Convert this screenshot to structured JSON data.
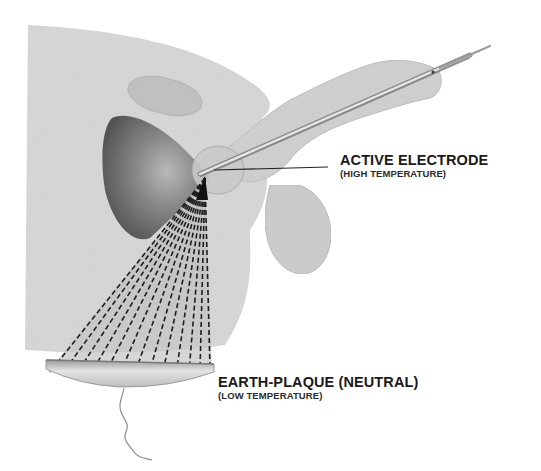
{
  "diagram": {
    "labels": {
      "active_electrode": {
        "title": "ACTIVE  ELECTRODE",
        "subtitle": "(HIGH TEMPERATURE)"
      },
      "earth_plaque": {
        "title": "EARTH-PLAQUE (NEUTRAL)",
        "subtitle": "(LOW TEMPERATURE)"
      }
    },
    "elements": [
      "body-cross-section",
      "pubic-bone",
      "bladder",
      "prostate",
      "penis",
      "scrotum",
      "resectoscope-electrode",
      "current-dispersion-lines",
      "earth-plaque-pad",
      "return-cable"
    ],
    "colors": {
      "body": "#d6d6d6",
      "organ_light": "#c8c8c8",
      "bladder_dark": "#6e6e6e",
      "lines": "#1e1e1e",
      "text": "#1a1a1a",
      "background": "#ffffff"
    }
  }
}
